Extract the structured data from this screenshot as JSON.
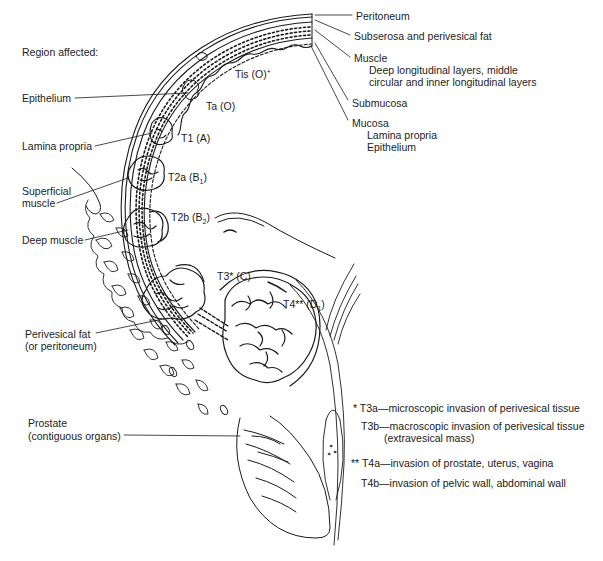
{
  "diagram": {
    "region_title": "Region affected:",
    "left_labels": {
      "epithelium": "Epithelium",
      "lamina_propria": "Lamina propria",
      "superficial_muscle_1": "Superficial",
      "superficial_muscle_2": "muscle",
      "deep_muscle": "Deep muscle",
      "perivesical_fat_1": "Perivesical fat",
      "perivesical_fat_2": "(or peritoneum)",
      "prostate_1": "Prostate",
      "prostate_2": "(contiguous organs)"
    },
    "layer_labels": {
      "peritoneum": "Peritoneum",
      "subserosa": "Subserosa and perivesical fat",
      "muscle": "Muscle",
      "muscle_desc_1": "Deep longitudinal layers, middle",
      "muscle_desc_2": "circular and inner longitudinal layers",
      "submucosa": "Submucosa",
      "mucosa": "Mucosa",
      "mucosa_lamina": "Lamina propria",
      "mucosa_epithelium": "Epithelium"
    },
    "stages": {
      "tis": {
        "main": "Tis (O)",
        "sup": "+"
      },
      "ta": {
        "main": "Ta (O)"
      },
      "t1": {
        "main": "T1 (A)"
      },
      "t2a": {
        "main": "T2a (B",
        "sub": "1",
        "close": ")"
      },
      "t2b": {
        "main": "T2b (B",
        "sub": "2",
        "close": ")"
      },
      "t3": {
        "main": "T3* (C)"
      },
      "t4": {
        "main": "T4** (D",
        "sub": "1",
        "close": ")"
      }
    },
    "footnotes": {
      "t3a": "* T3a—microscopic invasion of perivesical tissue",
      "t3b_1": "T3b—macroscopic invasion of perivesical tissue",
      "t3b_2": "(extravesical mass)",
      "t4a": "** T4a—invasion of prostate, uterus, vagina",
      "t4b": "T4b—invasion of pelvic wall, abdominal wall"
    },
    "colors": {
      "ink": "#1a1a1a",
      "background": "#ffffff"
    }
  }
}
